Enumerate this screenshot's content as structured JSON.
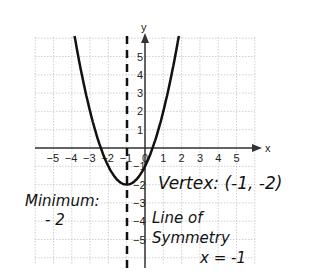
{
  "chart_data": {
    "type": "line",
    "title": "",
    "xlabel": "x",
    "ylabel": "y",
    "xlim": [
      -6,
      6
    ],
    "ylim": [
      -6,
      6
    ],
    "grid": true,
    "x_ticks": [
      "-5",
      "-4",
      "-3",
      "-2",
      "-1",
      "0",
      "1",
      "2",
      "3",
      "4",
      "5"
    ],
    "y_ticks": [
      "5",
      "4",
      "3",
      "2",
      "1",
      "-1",
      "-2",
      "-3",
      "-4",
      "-5"
    ],
    "series": [
      {
        "name": "parabola",
        "equation": "y = (x+1)^2 - 2",
        "x": [
          -5,
          -4,
          -3,
          -2,
          -1,
          0,
          1,
          2,
          3
        ],
        "values": [
          14,
          7,
          2,
          -1,
          -2,
          -1,
          2,
          7,
          14
        ]
      }
    ],
    "vertex": [
      -1,
      -2
    ],
    "axis_of_symmetry": -1,
    "annotations": [
      "Vertex: (-1, -2)",
      "Minimum: -2",
      "Line of Symmetry",
      "x = -1"
    ]
  },
  "labels": {
    "x_axis": "x",
    "y_axis": "y",
    "vertex": "Vertex: (-1, -2)",
    "minimum_title": "Minimum:",
    "minimum_value": "- 2",
    "symmetry_title": "Line of",
    "symmetry_title2": "Symmetry",
    "symmetry_eq": "x = -1"
  }
}
